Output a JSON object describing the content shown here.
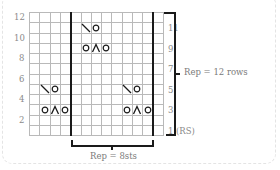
{
  "chart": {
    "columns": 13,
    "rows": 12,
    "cell_w": 10.3,
    "cell_h": 10.25,
    "thick_lines_after_col": [
      4,
      12
    ],
    "left_labels": [
      {
        "row": 12,
        "text": "12"
      },
      {
        "row": 10,
        "text": "10"
      },
      {
        "row": 8,
        "text": "8"
      },
      {
        "row": 6,
        "text": "6"
      },
      {
        "row": 4,
        "text": "4"
      },
      {
        "row": 2,
        "text": "2"
      }
    ],
    "right_labels": [
      {
        "row": 11,
        "text": "11"
      },
      {
        "row": 9,
        "text": "9"
      },
      {
        "row": 7,
        "text": "7"
      },
      {
        "row": 5,
        "text": "5"
      },
      {
        "row": 3,
        "text": "3"
      },
      {
        "row": 1,
        "text": "1 (RS)"
      }
    ],
    "symbols": [
      {
        "row": 11,
        "col": 6,
        "type": "k2tog"
      },
      {
        "row": 11,
        "col": 7,
        "type": "yo"
      },
      {
        "row": 9,
        "col": 6,
        "type": "yo"
      },
      {
        "row": 9,
        "col": 7,
        "type": "sk2po"
      },
      {
        "row": 9,
        "col": 8,
        "type": "yo"
      },
      {
        "row": 5,
        "col": 2,
        "type": "k2tog"
      },
      {
        "row": 5,
        "col": 3,
        "type": "yo"
      },
      {
        "row": 3,
        "col": 2,
        "type": "yo"
      },
      {
        "row": 3,
        "col": 3,
        "type": "sk2po"
      },
      {
        "row": 3,
        "col": 4,
        "type": "yo"
      },
      {
        "row": 5,
        "col": 10,
        "type": "k2tog"
      },
      {
        "row": 5,
        "col": 11,
        "type": "yo"
      },
      {
        "row": 3,
        "col": 10,
        "type": "yo"
      },
      {
        "row": 3,
        "col": 11,
        "type": "sk2po"
      },
      {
        "row": 3,
        "col": 12,
        "type": "yo"
      }
    ]
  },
  "repeat_rows_label": "Rep = 12 rows",
  "repeat_sts_label": "Rep = 8sts"
}
